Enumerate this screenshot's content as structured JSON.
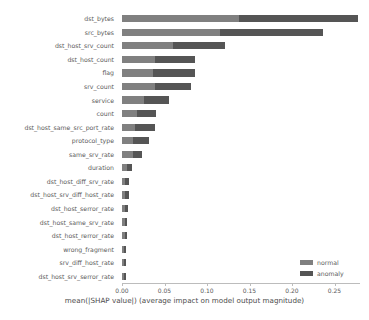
{
  "chart_data": {
    "type": "bar",
    "orientation": "horizontal",
    "stacked": true,
    "title": "",
    "xlabel": "mean(|SHAP value|) (average impact on model output magnitude)",
    "ylabel": "",
    "xlim": [
      0.0,
      0.28
    ],
    "xticks": [
      0.0,
      0.05,
      0.1,
      0.15,
      0.2,
      0.25
    ],
    "xticklabels": [
      "0.00",
      "0.05",
      "0.10",
      "0.15",
      "0.20",
      "0.25"
    ],
    "grid": false,
    "legend_position": "lower right",
    "categories": [
      "dst_bytes",
      "src_bytes",
      "dst_host_srv_count",
      "dst_host_count",
      "flag",
      "srv_count",
      "service",
      "count",
      "dst_host_same_src_port_rate",
      "protocol_type",
      "same_srv_rate",
      "duration",
      "dst_host_diff_srv_rate",
      "dst_host_srv_diff_host_rate",
      "dst_host_serror_rate",
      "dst_host_same_srv_rate",
      "dst_host_rerror_rate",
      "wrong_fragment",
      "srv_diff_host_rate",
      "dst_host_srv_serror_rate"
    ],
    "series": [
      {
        "name": "normal",
        "color": "#808080",
        "values": [
          0.1375,
          0.1155,
          0.06,
          0.039,
          0.037,
          0.039,
          0.0255,
          0.0175,
          0.0155,
          0.013,
          0.0125,
          0.006,
          0.004,
          0.004,
          0.0035,
          0.003,
          0.003,
          0.0025,
          0.0025,
          0.0025
        ]
      },
      {
        "name": "anomaly",
        "color": "#555555",
        "values": [
          0.1405,
          0.1205,
          0.061,
          0.0465,
          0.049,
          0.0425,
          0.03,
          0.0225,
          0.023,
          0.0185,
          0.0105,
          0.0055,
          0.004,
          0.004,
          0.0035,
          0.003,
          0.003,
          0.0025,
          0.0025,
          0.0025
        ]
      }
    ],
    "totals": [
      0.278,
      0.236,
      0.121,
      0.0855,
      0.086,
      0.0815,
      0.0555,
      0.04,
      0.0385,
      0.0315,
      0.023,
      0.0115,
      0.008,
      0.008,
      0.007,
      0.006,
      0.006,
      0.005,
      0.005,
      0.005
    ]
  },
  "legend": {
    "items": [
      {
        "label": "normal"
      },
      {
        "label": "anomaly"
      }
    ]
  },
  "axis": {
    "xlabel": "mean(|SHAP value|) (average impact on model output magnitude)"
  }
}
